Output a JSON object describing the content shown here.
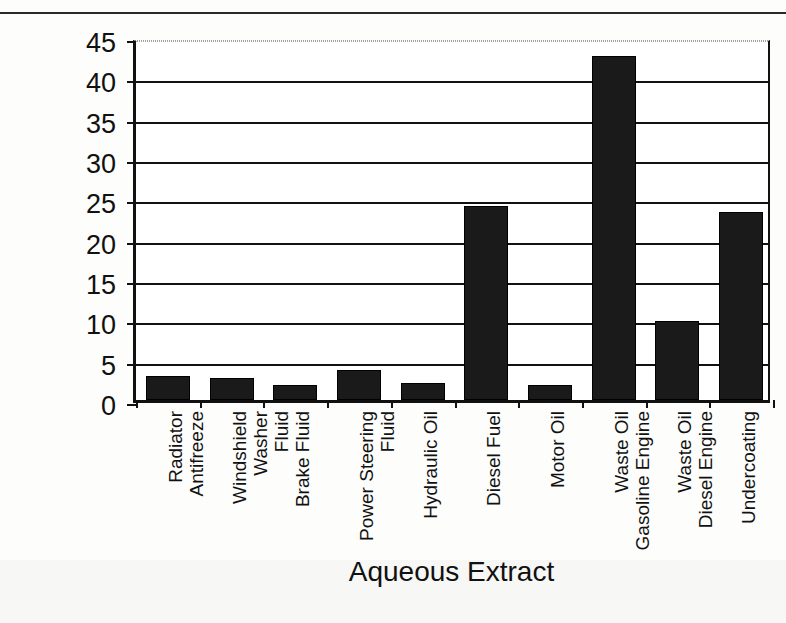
{
  "page": {
    "ghost_header_text": ""
  },
  "chart_data": {
    "type": "bar",
    "title": "",
    "xlabel": "Aqueous Extract",
    "ylabel": "EROD Induction (fold)",
    "ylim": [
      0,
      45
    ],
    "yticks": [
      0,
      5,
      10,
      15,
      20,
      25,
      30,
      35,
      40,
      45
    ],
    "grid": true,
    "legend": false,
    "bar_color": "#1a1a1a",
    "axis_color": "#111111",
    "categories": [
      "Radiator Antifreeze",
      "Windshield Washer\nFluid",
      "Brake Fluid",
      "Power Steering\nFluid",
      "Hydraulic Oil",
      "Diesel Fuel",
      "Motor Oil",
      "Waste Oil\nGasoline Engine",
      "Waste Oil\nDiesel Engine",
      "Undercoating"
    ],
    "values": [
      3.0,
      2.7,
      1.8,
      3.7,
      2.1,
      24.0,
      1.9,
      42.7,
      9.8,
      23.3
    ]
  }
}
